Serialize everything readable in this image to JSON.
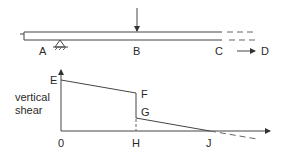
{
  "beam_diagram": {
    "points": {
      "A": "A",
      "B": "B",
      "C": "C",
      "D": "D"
    },
    "load_at": "B",
    "support_at": "A",
    "direction_arrow": "C to D"
  },
  "shear_diagram": {
    "y_axis_label_line1": "vertical",
    "y_axis_label_line2": "shear",
    "points": {
      "E": "E",
      "F": "F",
      "G": "G",
      "origin": "0",
      "H": "H",
      "J": "J"
    }
  },
  "colors": {
    "line": "#444444",
    "text": "#2a2a2a",
    "background": "#ffffff"
  }
}
